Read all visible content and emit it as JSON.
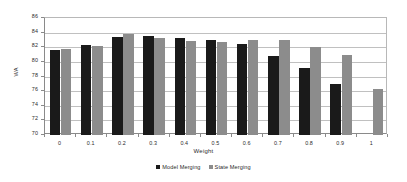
{
  "chart_data": {
    "type": "bar",
    "title": "",
    "xlabel": "Weight",
    "ylabel": "WA",
    "ylim": [
      70,
      86
    ],
    "ytick_step": 2,
    "yticks": [
      86,
      84,
      82,
      80,
      78,
      76,
      74,
      72,
      70
    ],
    "grid": true,
    "legend_position": "bottom",
    "categories": [
      "0",
      "0.1",
      "0.2",
      "0.3",
      "0.4",
      "0.5",
      "0.6",
      "0.7",
      "0.8",
      "0.9",
      "1"
    ],
    "series": [
      {
        "name": "Model Merging",
        "color": "#1a1a1a",
        "values": [
          81.6,
          82.35,
          83.45,
          83.6,
          83.3,
          83.05,
          82.5,
          80.85,
          79.15,
          77.0,
          null
        ]
      },
      {
        "name": "State Merging",
        "color": "#8c8c8c",
        "values": [
          81.7,
          82.15,
          83.8,
          83.3,
          82.9,
          82.7,
          83.05,
          83.05,
          82.05,
          81.0,
          76.35
        ]
      }
    ]
  },
  "axes": {
    "y_title": "WA",
    "x_title": "Weight"
  },
  "colors": {
    "model_merging": "#1a1a1a",
    "state_merging": "#8c8c8c",
    "gridline": "#c0c0c0",
    "axis": "#8a8a8a",
    "background": "#ffffff",
    "text": "#2b2b2b"
  }
}
